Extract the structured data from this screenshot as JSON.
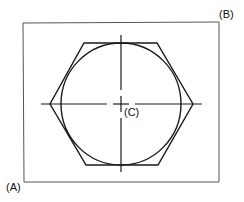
{
  "diagram": {
    "labels": {
      "corner_a": "(A)",
      "corner_b": "(B)",
      "center_c": "(C)"
    },
    "colors": {
      "stroke": "#1a1a1a",
      "frame": "#555555",
      "background": "#ffffff"
    },
    "rectangle": {
      "x1": 23,
      "y1": 23,
      "x2": 219,
      "y2": 182
    },
    "center": {
      "x": 121,
      "y": 104
    },
    "circle": {
      "rx": 61,
      "ry": 61
    },
    "hexagon": {
      "points": [
        [
          84,
          43
        ],
        [
          157,
          43
        ],
        [
          193,
          104
        ],
        [
          158,
          165
        ],
        [
          86,
          165
        ],
        [
          50,
          104
        ]
      ]
    },
    "centerlines": {
      "horizontal": {
        "x1": 41,
        "x2": 202
      },
      "vertical": {
        "y1": 35,
        "y2": 172
      }
    }
  }
}
